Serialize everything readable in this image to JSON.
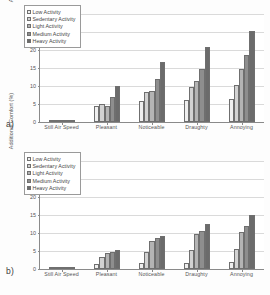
{
  "figure": {
    "panels": [
      {
        "label": "a)",
        "chart_index": 0
      },
      {
        "label": "b)",
        "chart_index": 1
      }
    ]
  },
  "chart_data": [
    {
      "type": "bar",
      "panel": "a)",
      "title": "",
      "xlabel": "",
      "ylabel": "Additional Comfort (%)",
      "ylim": [
        0,
        30
      ],
      "yticks": [
        0,
        5,
        10,
        15,
        20,
        25,
        30
      ],
      "ytick_labels": [
        "0",
        "5",
        "10",
        "15",
        "20",
        "25",
        "30"
      ],
      "grid": true,
      "legend_position": "upper left",
      "categories": [
        "Still Air Speed",
        "Pleasant",
        "Noticeable",
        "Draughty",
        "Annoying"
      ],
      "series": [
        {
          "name": "Low Activity",
          "values": [
            0.4,
            4.5,
            5.9,
            6.2,
            6.3
          ]
        },
        {
          "name": "Sedentary Activity",
          "values": [
            0.5,
            4.9,
            8.4,
            9.6,
            10.4
          ]
        },
        {
          "name": "Light Activity",
          "values": [
            0.4,
            4.5,
            8.6,
            11.3,
            14.8
          ]
        },
        {
          "name": "Medium Activity",
          "values": [
            0.3,
            6.9,
            11.9,
            14.8,
            18.7
          ]
        },
        {
          "name": "Heavy Activity",
          "values": [
            0.6,
            9.9,
            16.7,
            20.7,
            25.2
          ]
        }
      ]
    },
    {
      "type": "bar",
      "panel": "b)",
      "title": "",
      "xlabel": "",
      "ylabel": "Additional Comfort (%)",
      "ylim": [
        0,
        30
      ],
      "yticks": [
        0,
        5,
        10,
        15,
        20,
        25,
        30
      ],
      "ytick_labels": [
        "0",
        "5",
        "10",
        "15",
        "20",
        "25",
        "30"
      ],
      "grid": true,
      "legend_position": "upper left",
      "categories": [
        "Still Air Speed",
        "Pleasant",
        "Noticeable",
        "Draughty",
        "Annoying"
      ],
      "series": [
        {
          "name": "Low Activity",
          "values": [
            0.1,
            1.5,
            1.6,
            1.7,
            2.0
          ]
        },
        {
          "name": "Sedentary Activity",
          "values": [
            0.1,
            3.3,
            4.8,
            5.3,
            5.5
          ]
        },
        {
          "name": "Light Activity",
          "values": [
            0.1,
            4.4,
            7.8,
            9.6,
            10.3
          ]
        },
        {
          "name": "Medium Activity",
          "values": [
            0.1,
            4.7,
            8.6,
            10.6,
            12.0
          ]
        },
        {
          "name": "Heavy Activity",
          "values": [
            0.2,
            5.3,
            9.3,
            12.6,
            14.9
          ]
        }
      ]
    }
  ],
  "colors": {
    "series": [
      "#efefef",
      "#d2d2d2",
      "#b4b4b4",
      "#8e8e8e",
      "#6b6b6b"
    ],
    "axis": "#8a8a8a",
    "grid": "#dadada",
    "text": "#555555",
    "background": "#ffffff"
  }
}
